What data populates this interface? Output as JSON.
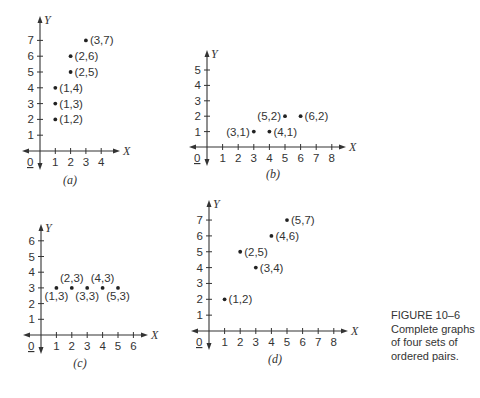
{
  "caption": {
    "figure_label": "FIGURE 10–6",
    "lines": [
      "Complete graphs",
      "of four sets of",
      "ordered pairs."
    ]
  },
  "chart_data": [
    {
      "type": "scatter",
      "panel": "(a)",
      "xlabel": "X",
      "ylabel": "Y",
      "origin_label": "0",
      "x_ticks": [
        1,
        2,
        3,
        4
      ],
      "y_ticks": [
        1,
        2,
        3,
        4,
        5,
        6,
        7
      ],
      "points": [
        [
          1,
          2
        ],
        [
          1,
          3
        ],
        [
          1,
          4
        ],
        [
          2,
          5
        ],
        [
          2,
          6
        ],
        [
          3,
          7
        ]
      ],
      "point_labels": [
        "(1,2)",
        "(1,3)",
        "(1,4)",
        "(2,5)",
        "(2,6)",
        "(3,7)"
      ],
      "label_side": [
        "right",
        "right",
        "right",
        "right",
        "right",
        "right"
      ],
      "layout": {
        "ox": 40,
        "oy": 151,
        "ux": 15.3,
        "uy": 15.8,
        "xmin_px": 22,
        "xmax_px": 120,
        "ytop_px": 16,
        "ybot_px": 170,
        "sub_x": 70,
        "sub_y": 184
      }
    },
    {
      "type": "scatter",
      "panel": "(b)",
      "xlabel": "X",
      "ylabel": "Y",
      "origin_label": "0",
      "x_ticks": [
        1,
        2,
        3,
        4,
        5,
        6,
        7,
        8
      ],
      "y_ticks": [
        1,
        2,
        3,
        4,
        5
      ],
      "points": [
        [
          3,
          1
        ],
        [
          4,
          1
        ],
        [
          5,
          2
        ],
        [
          6,
          2
        ]
      ],
      "point_labels": [
        "(3,1)",
        "(4,1)",
        "(5,2)",
        "(6,2)"
      ],
      "label_side": [
        "left",
        "right",
        "left",
        "right"
      ],
      "layout": {
        "ox": 207,
        "oy": 147,
        "ux": 15.6,
        "uy": 15.4,
        "xmin_px": 189,
        "xmax_px": 346,
        "ytop_px": 50,
        "ybot_px": 166,
        "sub_x": 273,
        "sub_y": 178
      }
    },
    {
      "type": "scatter",
      "panel": "(c)",
      "xlabel": "X",
      "ylabel": "Y",
      "origin_label": "0",
      "x_ticks": [
        1,
        2,
        3,
        4,
        5,
        6
      ],
      "y_ticks": [
        1,
        2,
        3,
        4,
        5,
        6
      ],
      "points": [
        [
          1,
          3
        ],
        [
          2,
          3
        ],
        [
          3,
          3
        ],
        [
          4,
          3
        ],
        [
          5,
          3
        ]
      ],
      "point_labels": [
        "(1,3)",
        "(2,3)",
        "(3,3)",
        "(4,3)",
        "(5,3)"
      ],
      "label_side": [
        "below",
        "above",
        "below",
        "above",
        "below"
      ],
      "layout": {
        "ox": 41,
        "oy": 335,
        "ux": 15.4,
        "uy": 15.7,
        "xmin_px": 23,
        "xmax_px": 148,
        "ytop_px": 224,
        "ybot_px": 354,
        "sub_x": 80,
        "sub_y": 367
      }
    },
    {
      "type": "scatter",
      "panel": "(d)",
      "xlabel": "X",
      "ylabel": "Y",
      "origin_label": "0",
      "x_ticks": [
        1,
        2,
        3,
        4,
        5,
        6,
        7,
        8
      ],
      "y_ticks": [
        1,
        2,
        3,
        4,
        5,
        6,
        7
      ],
      "points": [
        [
          1,
          2
        ],
        [
          2,
          5
        ],
        [
          3,
          4
        ],
        [
          4,
          6
        ],
        [
          5,
          7
        ]
      ],
      "point_labels": [
        "(1,2)",
        "(2,5)",
        "(3,4)",
        "(4,6)",
        "(5,7)"
      ],
      "label_side": [
        "right",
        "right",
        "right",
        "right",
        "right"
      ],
      "layout": {
        "ox": 209,
        "oy": 331,
        "ux": 15.6,
        "uy": 15.85,
        "xmin_px": 191,
        "xmax_px": 348,
        "ytop_px": 200,
        "ybot_px": 350,
        "sub_x": 275,
        "sub_y": 363
      }
    }
  ]
}
